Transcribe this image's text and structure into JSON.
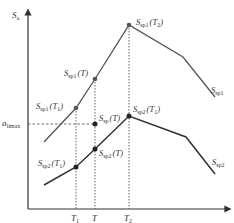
{
  "diagram": {
    "y_axis_label": "S",
    "y_axis_label_sub": "a",
    "x_ticks": [
      {
        "label": "T",
        "sub": "1"
      },
      {
        "label": "T",
        "sub": ""
      },
      {
        "label": "T",
        "sub": "2"
      }
    ],
    "threshold": {
      "label": "a",
      "sub": "limax"
    },
    "curves": [
      {
        "name": "S",
        "sub": "sp1"
      },
      {
        "name": "S",
        "sub": "sp2"
      }
    ],
    "points": [
      {
        "label": "S",
        "sub": "sp1",
        "arg": "(T",
        "argsub": "2",
        "close": ")"
      },
      {
        "label": "S",
        "sub": "sp1",
        "arg": "(T)",
        "argsub": "",
        "close": ""
      },
      {
        "label": "S",
        "sub": "sp1",
        "arg": "(T",
        "argsub": "1",
        "close": ")"
      },
      {
        "label": "S",
        "sub": "sp",
        "arg": "(T)",
        "argsub": "",
        "close": ""
      },
      {
        "label": "S",
        "sub": "sp2",
        "arg": "(T",
        "argsub": "1",
        "close": ")"
      },
      {
        "label": "S",
        "sub": "sp2",
        "arg": "(T)",
        "argsub": "",
        "close": ""
      },
      {
        "label": "S",
        "sub": "sp2",
        "arg": "(T",
        "argsub": "1",
        "close": ")"
      }
    ],
    "colors": {
      "axis": "#333333",
      "line": "#555555",
      "point": "#222222",
      "guide": "#444444"
    }
  }
}
